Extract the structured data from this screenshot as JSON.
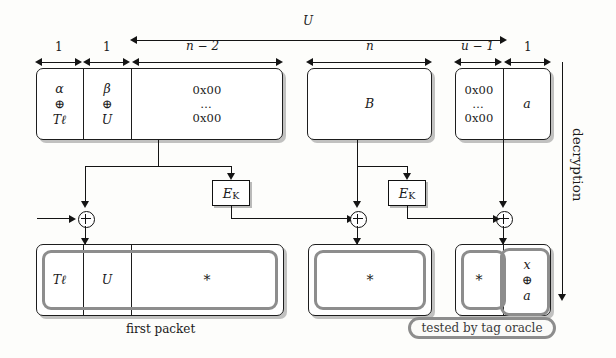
{
  "figure": {
    "title_arrow_label": "U",
    "side_label": "decryption",
    "first_packet_caption": "first packet",
    "tag_oracle_caption": "tested by tag oracle"
  },
  "dimensions": [
    {
      "name": "alpha-cell-width",
      "label": "1"
    },
    {
      "name": "beta-cell-width",
      "label": "1"
    },
    {
      "name": "zero-pad-width",
      "label": "n − 2"
    },
    {
      "name": "block-b-width",
      "label": "n"
    },
    {
      "name": "zero-tail-width",
      "label": "u − 1"
    },
    {
      "name": "a-cell-width",
      "label": "1"
    }
  ],
  "top_row": {
    "block1": {
      "cells": [
        {
          "name": "cell-alpha",
          "lines": [
            "α",
            "⊕",
            "Tℓ"
          ]
        },
        {
          "name": "cell-beta",
          "lines": [
            "β",
            "⊕",
            "U"
          ]
        },
        {
          "name": "cell-zero-pad",
          "lines": [
            "0x00",
            "…",
            "0x00"
          ]
        }
      ]
    },
    "block2": {
      "cells": [
        {
          "name": "cell-b",
          "lines": [
            "B"
          ]
        }
      ]
    },
    "block3": {
      "cells": [
        {
          "name": "cell-zero-tail",
          "lines": [
            "0x00",
            "…",
            "0x00"
          ]
        },
        {
          "name": "cell-a",
          "lines": [
            "a"
          ]
        }
      ]
    }
  },
  "cipher": {
    "ek_label": "E",
    "ek_sub": "K",
    "blocks": [
      {
        "name": "ek-block-1"
      },
      {
        "name": "ek-block-2"
      }
    ],
    "xor_symbol": "⊕",
    "xors": [
      {
        "name": "xor-gate-1"
      },
      {
        "name": "xor-gate-2"
      },
      {
        "name": "xor-gate-3"
      }
    ]
  },
  "bottom_row": {
    "block1": {
      "cells": [
        {
          "name": "out-cell-tag",
          "lines": [
            "Tℓ"
          ]
        },
        {
          "name": "out-cell-u",
          "lines": [
            "U"
          ]
        },
        {
          "name": "out-cell-star-1",
          "lines": [
            "*"
          ]
        }
      ]
    },
    "block2": {
      "cells": [
        {
          "name": "out-cell-star-2",
          "lines": [
            "*"
          ]
        }
      ]
    },
    "block3": {
      "cells": [
        {
          "name": "out-cell-star-3",
          "lines": [
            "*"
          ]
        },
        {
          "name": "out-cell-xa",
          "lines": [
            "x",
            "⊕",
            "a"
          ]
        }
      ]
    }
  },
  "colors": {
    "ink": "#141414",
    "highlight": "#8d8d8d",
    "paper": "#fdfdfb"
  }
}
